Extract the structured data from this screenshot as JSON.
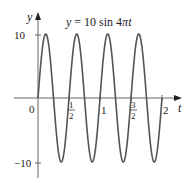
{
  "chart_data": {
    "type": "line",
    "title": "y = 10 sin 4πt",
    "title_parts": {
      "lhs": "y",
      "eq": " = 10 sin 4",
      "pi": "π",
      "var": "t"
    },
    "xlabel": "t",
    "ylabel": "y",
    "function": "10*sin(4*pi*t)",
    "xlim": [
      0,
      2
    ],
    "ylim": [
      -10,
      10
    ],
    "x_ticks": [
      {
        "value": 0,
        "label": "0"
      },
      {
        "value": 0.5,
        "label_num": "1",
        "label_den": "2"
      },
      {
        "value": 1,
        "label": "1"
      },
      {
        "value": 1.5,
        "label_num": "3",
        "label_den": "2"
      },
      {
        "value": 2,
        "label": "2"
      }
    ],
    "y_ticks": [
      {
        "value": 10,
        "label": "10"
      },
      {
        "value": -10,
        "label": "−10"
      }
    ],
    "grid": false,
    "legend": null,
    "series": [
      {
        "name": "y = 10 sin 4πt",
        "color": "#555555",
        "x": [
          0,
          0.125,
          0.25,
          0.375,
          0.5,
          0.625,
          0.75,
          0.875,
          1,
          1.125,
          1.25,
          1.375,
          1.5,
          1.625,
          1.75,
          1.875,
          2
        ],
        "values": [
          0,
          10,
          0,
          -10,
          0,
          10,
          0,
          -10,
          0,
          10,
          0,
          -10,
          0,
          10,
          0,
          -10,
          0
        ]
      }
    ]
  }
}
